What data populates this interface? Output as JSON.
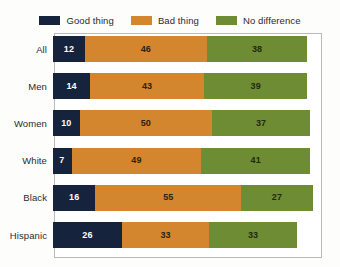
{
  "legend": {
    "entries": [
      {
        "label": "Good thing",
        "color": "#16233C",
        "key": "good"
      },
      {
        "label": "Bad thing",
        "color": "#D4862E",
        "key": "bad"
      },
      {
        "label": "No difference",
        "color": "#6E8C33",
        "key": "nodiff"
      }
    ]
  },
  "chart_data": {
    "type": "bar",
    "subtype": "stacked-horizontal",
    "title": "",
    "xlabel": "",
    "ylabel": "",
    "xlim": [
      0,
      100
    ],
    "grid": false,
    "legend_position": "top",
    "categories": [
      "All",
      "Men",
      "Women",
      "White",
      "Black",
      "Hispanic"
    ],
    "series": [
      {
        "name": "Good thing",
        "color": "#16233C",
        "values": [
          12,
          14,
          10,
          7,
          16,
          26
        ]
      },
      {
        "name": "Bad thing",
        "color": "#D4862E",
        "values": [
          46,
          43,
          50,
          49,
          55,
          33
        ]
      },
      {
        "name": "No difference",
        "color": "#6E8C33",
        "values": [
          38,
          39,
          37,
          41,
          27,
          33
        ]
      }
    ],
    "rows": [
      {
        "label": "All",
        "good": 12,
        "bad": 46,
        "nodiff": 38
      },
      {
        "label": "Men",
        "good": 14,
        "bad": 43,
        "nodiff": 39
      },
      {
        "label": "Women",
        "good": 10,
        "bad": 50,
        "nodiff": 37
      },
      {
        "label": "White",
        "good": 7,
        "bad": 49,
        "nodiff": 41
      },
      {
        "label": "Black",
        "good": 16,
        "bad": 55,
        "nodiff": 27
      },
      {
        "label": "Hispanic",
        "good": 26,
        "bad": 33,
        "nodiff": 33
      }
    ]
  },
  "colors": {
    "good": "#16233C",
    "bad": "#D4862E",
    "nodiff": "#6E8C33",
    "background": "#fdfdfb",
    "plot_background": "#ffffff",
    "plot_border": "#b9bbb8",
    "label_text": "#2b2b2b"
  }
}
